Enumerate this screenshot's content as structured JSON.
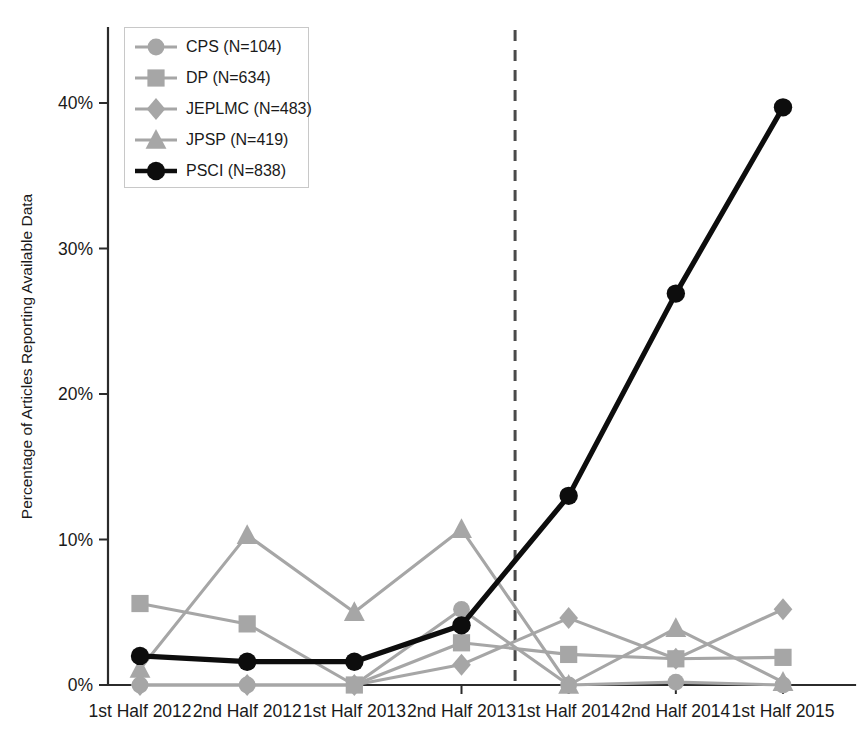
{
  "chart_data": {
    "type": "line",
    "title": "",
    "subtitle": "",
    "xlabel": "",
    "ylabel": "Percentage of Articles Reporting Available Data",
    "categories": [
      "1st Half 2012",
      "2nd Half 2012",
      "1st Half 2013",
      "2nd Half 2013",
      "1st Half 2014",
      "2nd Half 2014",
      "1st Half 2015"
    ],
    "ylim": [
      0,
      45
    ],
    "yticks": [
      0,
      10,
      20,
      30,
      40
    ],
    "ytick_labels": [
      "0%",
      "10%",
      "20%",
      "30%",
      "40%"
    ],
    "grid": false,
    "legend_position": "top-left",
    "series": [
      {
        "name": "CPS (N=104)",
        "label": "CPS (N=104)",
        "marker": "circle",
        "color": "#a6a6a6",
        "emphasis": false,
        "values": [
          0.0,
          0.0,
          0.0,
          5.2,
          0.0,
          0.2,
          0.0
        ]
      },
      {
        "name": "DP (N=634)",
        "label": "DP (N=634)",
        "marker": "square",
        "color": "#a6a6a6",
        "emphasis": false,
        "values": [
          5.6,
          4.2,
          0.0,
          2.9,
          2.1,
          1.8,
          1.9
        ]
      },
      {
        "name": "JEPLMC (N=483)",
        "label": "JEPLMC (N=483)",
        "marker": "diamond",
        "color": "#a6a6a6",
        "emphasis": false,
        "values": [
          0.0,
          0.0,
          0.0,
          1.4,
          4.6,
          1.8,
          5.2
        ]
      },
      {
        "name": "JPSP (N=419)",
        "label": "JPSP (N=419)",
        "marker": "triangle",
        "color": "#a6a6a6",
        "emphasis": false,
        "values": [
          1.1,
          10.3,
          5.0,
          10.7,
          0.0,
          3.9,
          0.2
        ]
      },
      {
        "name": "PSCI (N=838)",
        "label": "PSCI (N=838)",
        "marker": "circle",
        "color": "#0d0d0d",
        "emphasis": true,
        "values": [
          2.0,
          1.6,
          1.6,
          4.1,
          13.0,
          26.9,
          39.7
        ]
      }
    ],
    "annotations": [
      {
        "type": "vertical-dashed-line",
        "name": "policy-change-divider",
        "between": [
          "2nd Half 2013",
          "1st Half 2014"
        ],
        "color": "#4a4a4a"
      }
    ]
  },
  "legend": {
    "items": [
      {
        "label": "CPS (N=104)",
        "marker": "circle",
        "color": "#a6a6a6"
      },
      {
        "label": "DP (N=634)",
        "marker": "square",
        "color": "#a6a6a6"
      },
      {
        "label": "JEPLMC (N=483)",
        "marker": "diamond",
        "color": "#a6a6a6"
      },
      {
        "label": "JPSP (N=419)",
        "marker": "triangle",
        "color": "#a6a6a6"
      },
      {
        "label": "PSCI (N=838)",
        "marker": "circle",
        "color": "#0d0d0d"
      }
    ]
  }
}
